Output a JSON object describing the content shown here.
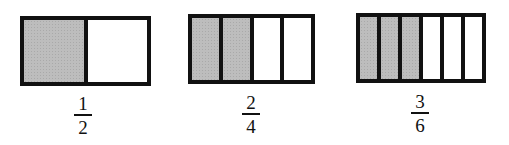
{
  "diagram": {
    "colors": {
      "shaded": "#bdbdbd",
      "border": "#111111",
      "unshaded": "#ffffff"
    },
    "models": [
      {
        "parts": 2,
        "shaded": 1,
        "fraction": {
          "numerator": "1",
          "denominator": "2"
        }
      },
      {
        "parts": 4,
        "shaded": 2,
        "fraction": {
          "numerator": "2",
          "denominator": "4"
        }
      },
      {
        "parts": 6,
        "shaded": 3,
        "fraction": {
          "numerator": "3",
          "denominator": "6"
        }
      }
    ]
  }
}
